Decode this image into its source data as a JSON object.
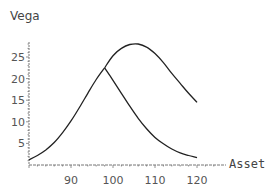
{
  "chart_data": {
    "type": "line",
    "title": "",
    "ylabel": "Vega",
    "xlabel": "Asset",
    "xlim": [
      80,
      120
    ],
    "ylim": [
      0,
      28
    ],
    "grid": false,
    "legend": null,
    "x_ticks": [
      90,
      100,
      110,
      120
    ],
    "y_ticks": [
      5,
      10,
      15,
      20,
      25
    ],
    "series": [
      {
        "name": "Vega (shorter maturity)",
        "x": [
          80,
          82,
          84,
          86,
          88,
          90,
          92,
          94,
          96,
          98,
          100,
          102,
          104,
          106,
          108,
          110,
          112,
          114,
          116,
          118,
          120
        ],
        "y": [
          1.2,
          2.2,
          3.5,
          5.2,
          7.5,
          10.2,
          13.3,
          16.6,
          19.8,
          22.5,
          19.6,
          16.6,
          13.6,
          10.8,
          8.4,
          6.4,
          4.9,
          3.7,
          2.8,
          2.2,
          1.7
        ]
      },
      {
        "name": "Vega (longer maturity)",
        "x": [
          98,
          100,
          102,
          104,
          106,
          108,
          110,
          112,
          114,
          116,
          118,
          120
        ],
        "y": [
          22.5,
          25.3,
          27.0,
          27.9,
          28.0,
          27.3,
          25.8,
          23.7,
          21.2,
          18.9,
          16.6,
          14.5
        ]
      }
    ]
  },
  "labels": {
    "y_title": "Vega",
    "x_title": "Asset",
    "x_ticks": [
      "90",
      "100",
      "110",
      "120"
    ],
    "y_ticks": [
      "5",
      "10",
      "15",
      "20",
      "25"
    ]
  }
}
